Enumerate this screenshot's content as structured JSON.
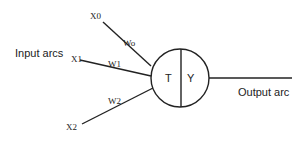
{
  "diagram": {
    "group_labels": {
      "input": "Input arcs",
      "output": "Output arc"
    },
    "inputs": [
      {
        "name": "X0",
        "weight": "Wo"
      },
      {
        "name": "X1",
        "weight": "W1"
      },
      {
        "name": "X2",
        "weight": "W2"
      }
    ],
    "node": {
      "left_label": "T",
      "right_label": "Y"
    },
    "colors": {
      "stroke": "#222222",
      "background": "#ffffff"
    }
  }
}
